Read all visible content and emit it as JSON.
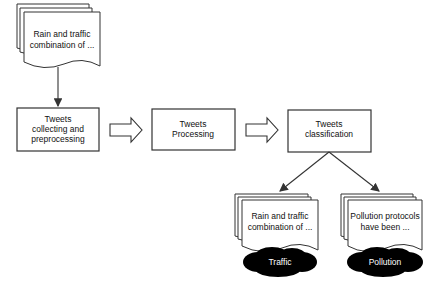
{
  "diagram": {
    "input_document": {
      "lines": [
        "Rain and traffic",
        "combination of ..."
      ]
    },
    "process_boxes": [
      {
        "lines": [
          "Tweets",
          "collecting and",
          "preprocessing"
        ]
      },
      {
        "lines": [
          "Tweets",
          "Processing"
        ]
      },
      {
        "lines": [
          "Tweets",
          "classification"
        ]
      }
    ],
    "output_documents": [
      {
        "lines": [
          "Rain and traffic",
          "combination of ..."
        ],
        "category": "Traffic"
      },
      {
        "lines": [
          "Pollution protocols",
          "have been ..."
        ],
        "category": "Pollution"
      }
    ],
    "colors": {
      "stroke": "#333333",
      "cloud": "#000000",
      "cloud_text": "#ffffff"
    }
  }
}
